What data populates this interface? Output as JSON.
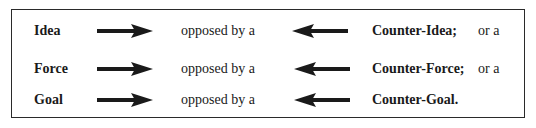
{
  "diagram": {
    "rows": [
      {
        "term": "Idea",
        "connector": "opposed by a",
        "counter": "Counter-Idea;",
        "suffix": "or a"
      },
      {
        "term": "Force",
        "connector": "opposed by a",
        "counter": "Counter-Force;",
        "suffix": "or a"
      },
      {
        "term": "Goal",
        "connector": "opposed by a",
        "counter": "Counter-Goal.",
        "suffix": ""
      }
    ],
    "arrows": {
      "forward": "right-arrow",
      "opposing": "left-arrow"
    },
    "colors": {
      "ink": "#1a1a1a",
      "border": "#2a2a2a",
      "background": "#ffffff"
    }
  }
}
